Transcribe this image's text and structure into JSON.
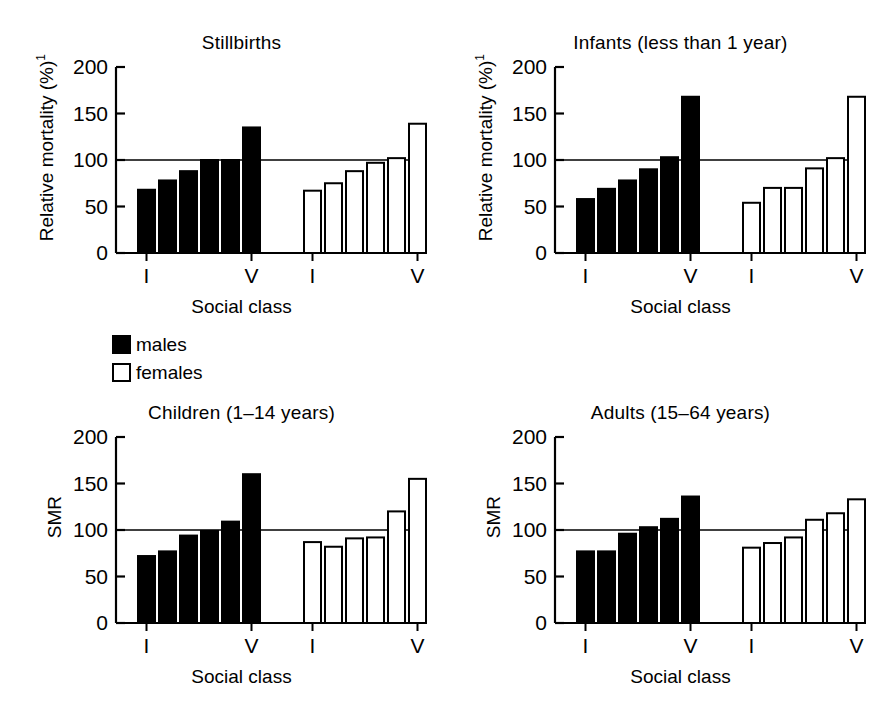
{
  "legend": {
    "items": [
      {
        "key": "males",
        "label": "males",
        "fill": "#000000"
      },
      {
        "key": "females",
        "label": "females",
        "fill": "#ffffff"
      }
    ]
  },
  "panels": [
    {
      "id": "stillbirths",
      "title": "Stillbirths",
      "ylabel": "Relative mortality (%)",
      "ylabel_sup": "1",
      "xlabel": "Social class",
      "first_tick": "I",
      "last_tick": "V"
    },
    {
      "id": "infants",
      "title": "Infants (less than 1 year)",
      "ylabel": "Relative mortality (%)",
      "ylabel_sup": "1",
      "xlabel": "Social class",
      "first_tick": "I",
      "last_tick": "V"
    },
    {
      "id": "children",
      "title": "Children (1–14 years)",
      "ylabel": "SMR",
      "ylabel_sup": "",
      "xlabel": "Social class",
      "first_tick": "I",
      "last_tick": "V"
    },
    {
      "id": "adults",
      "title": "Adults (15–64 years)",
      "ylabel": "SMR",
      "ylabel_sup": "",
      "xlabel": "Social class",
      "first_tick": "I",
      "last_tick": "V"
    }
  ],
  "chart_data": [
    {
      "type": "bar",
      "id": "stillbirths",
      "title": "Stillbirths",
      "xlabel": "Social class",
      "ylabel": "Relative mortality (%)¹",
      "ylim": [
        0,
        200
      ],
      "yticks": [
        0,
        50,
        100,
        150,
        200
      ],
      "reference_line": 100,
      "grid": false,
      "legend_position": "outside-below-left",
      "categories": [
        "I",
        "II",
        "IIIN",
        "IIIM",
        "IV",
        "V"
      ],
      "category_tick_labels": [
        "I",
        "",
        "",
        "",
        "",
        "V"
      ],
      "series": [
        {
          "name": "males",
          "fill": "#000000",
          "values": [
            68,
            78,
            88,
            100,
            100,
            135
          ]
        },
        {
          "name": "females",
          "fill": "#ffffff",
          "values": [
            67,
            75,
            88,
            97,
            102,
            139
          ]
        }
      ]
    },
    {
      "type": "bar",
      "id": "infants",
      "title": "Infants (less than 1 year)",
      "xlabel": "Social class",
      "ylabel": "Relative mortality (%)¹",
      "ylim": [
        0,
        200
      ],
      "yticks": [
        0,
        50,
        100,
        150,
        200
      ],
      "reference_line": 100,
      "grid": false,
      "legend_position": "outside-below-left",
      "categories": [
        "I",
        "II",
        "IIIN",
        "IIIM",
        "IV",
        "V"
      ],
      "category_tick_labels": [
        "I",
        "",
        "",
        "",
        "",
        "V"
      ],
      "series": [
        {
          "name": "males",
          "fill": "#000000",
          "values": [
            58,
            69,
            78,
            90,
            103,
            168
          ]
        },
        {
          "name": "females",
          "fill": "#ffffff",
          "values": [
            54,
            70,
            70,
            91,
            102,
            168
          ]
        }
      ]
    },
    {
      "type": "bar",
      "id": "children",
      "title": "Children (1–14 years)",
      "xlabel": "Social class",
      "ylabel": "SMR",
      "ylim": [
        0,
        200
      ],
      "yticks": [
        0,
        50,
        100,
        150,
        200
      ],
      "reference_line": 100,
      "grid": false,
      "legend_position": "outside-above-left",
      "categories": [
        "I",
        "II",
        "IIIN",
        "IIIM",
        "IV",
        "V"
      ],
      "category_tick_labels": [
        "I",
        "",
        "",
        "",
        "",
        "V"
      ],
      "series": [
        {
          "name": "males",
          "fill": "#000000",
          "values": [
            72,
            77,
            94,
            99,
            109,
            160
          ]
        },
        {
          "name": "females",
          "fill": "#ffffff",
          "values": [
            87,
            82,
            91,
            92,
            120,
            155
          ]
        }
      ]
    },
    {
      "type": "bar",
      "id": "adults",
      "title": "Adults (15–64 years)",
      "xlabel": "Social class",
      "ylabel": "SMR",
      "ylim": [
        0,
        200
      ],
      "yticks": [
        0,
        50,
        100,
        150,
        200
      ],
      "reference_line": 100,
      "grid": false,
      "legend_position": "outside-above-left",
      "categories": [
        "I",
        "II",
        "IIIN",
        "IIIM",
        "IV",
        "V"
      ],
      "category_tick_labels": [
        "I",
        "",
        "",
        "",
        "",
        "V"
      ],
      "series": [
        {
          "name": "males",
          "fill": "#000000",
          "values": [
            77,
            77,
            96,
            103,
            112,
            136
          ]
        },
        {
          "name": "females",
          "fill": "#ffffff",
          "values": [
            81,
            86,
            92,
            111,
            118,
            133
          ]
        }
      ]
    }
  ]
}
